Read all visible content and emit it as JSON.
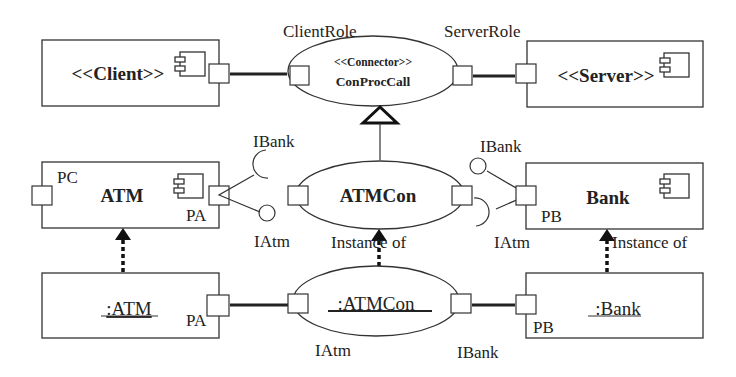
{
  "diagram": {
    "top_row": {
      "client": {
        "label": "<<Client>>",
        "icon": "component-icon"
      },
      "connector": {
        "stereotype": "<<Connector>>",
        "name": "ConProcCall",
        "client_role": "ClientRole",
        "server_role": "ServerRole"
      },
      "server": {
        "label": "<<Server>>",
        "icon": "component-icon"
      }
    },
    "middle_row": {
      "atm": {
        "name": "ATM",
        "port_left": "PC",
        "port_right": "PA",
        "icon": "component-icon"
      },
      "atm_interfaces": {
        "required": "IBank",
        "provided": "IAtm"
      },
      "connector": {
        "name": "ATMCon"
      },
      "bank_interfaces": {
        "provided": "IBank",
        "required": "IAtm"
      },
      "bank": {
        "name": "Bank",
        "port": "PB",
        "icon": "component-icon"
      }
    },
    "bottom_row": {
      "atm_instance": {
        "name": ":ATM",
        "port": "PA"
      },
      "connector_instance": {
        "name": ":ATMCon",
        "left_iface": "IAtm",
        "right_iface": "IBank"
      },
      "bank_instance": {
        "name": ":Bank",
        "port": "PB"
      }
    },
    "relations": {
      "instance_of_connector": "Instance of",
      "instance_of_bank": "Instance of"
    }
  }
}
